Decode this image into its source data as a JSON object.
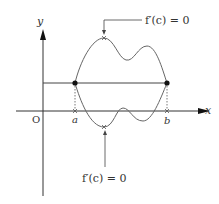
{
  "diagram": {
    "type": "rolle-theorem-illustration",
    "axes": {
      "x_label": "x",
      "y_label": "y",
      "origin_label": "O"
    },
    "points": {
      "a_label": "a",
      "b_label": "b"
    },
    "annotations": {
      "top_callout": "f′(c) = 0",
      "bottom_callout": "f′(c) = 0"
    },
    "curves": [
      {
        "name": "upper-curve",
        "description": "curve through (a,f(a)) and (b,f(b)) above the chord with a maximum where f'(c)=0"
      },
      {
        "name": "lower-curve",
        "description": "curve through (a,f(a)) and (b,f(b)) dipping below the x-axis with a minimum where f'(c)=0"
      }
    ],
    "colors": {
      "curve": "#666666",
      "axis": "#333333",
      "point": "#111111"
    }
  }
}
